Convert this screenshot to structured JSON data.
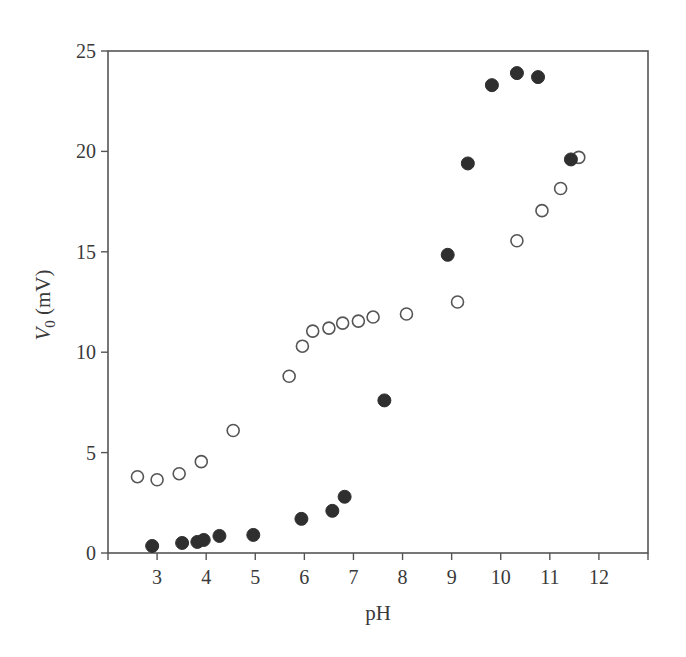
{
  "chart_data": {
    "type": "scatter",
    "title": "",
    "xlabel": "pH",
    "ylabel_main": "V",
    "ylabel_sub": "0",
    "ylabel_unit": " (mV)",
    "ylabel": "V0 (mV)",
    "xlim": [
      2,
      13
    ],
    "ylim": [
      0,
      25
    ],
    "x_ticks": [
      3,
      4,
      5,
      6,
      7,
      8,
      9,
      10,
      11,
      12
    ],
    "y_ticks": [
      0,
      5,
      10,
      15,
      20,
      25
    ],
    "grid": false,
    "legend": null,
    "series": [
      {
        "name": "open circles",
        "marker": "open-circle",
        "points": [
          [
            2.6,
            3.8
          ],
          [
            3.0,
            3.65
          ],
          [
            3.45,
            3.95
          ],
          [
            3.9,
            4.55
          ],
          [
            4.55,
            6.1
          ],
          [
            5.69,
            8.8
          ],
          [
            5.96,
            10.3
          ],
          [
            6.17,
            11.05
          ],
          [
            6.5,
            11.2
          ],
          [
            6.78,
            11.45
          ],
          [
            7.1,
            11.55
          ],
          [
            7.4,
            11.75
          ],
          [
            8.08,
            11.9
          ],
          [
            9.12,
            12.5
          ],
          [
            10.33,
            15.55
          ],
          [
            10.84,
            17.05
          ],
          [
            11.22,
            18.15
          ],
          [
            11.59,
            19.7
          ]
        ]
      },
      {
        "name": "filled circles",
        "marker": "filled-circle",
        "points": [
          [
            2.9,
            0.35
          ],
          [
            3.51,
            0.5
          ],
          [
            3.82,
            0.55
          ],
          [
            3.95,
            0.65
          ],
          [
            4.27,
            0.85
          ],
          [
            4.96,
            0.9
          ],
          [
            5.94,
            1.7
          ],
          [
            6.57,
            2.1
          ],
          [
            6.82,
            2.8
          ],
          [
            7.63,
            7.6
          ],
          [
            8.92,
            14.85
          ],
          [
            9.33,
            19.4
          ],
          [
            9.82,
            23.3
          ],
          [
            10.33,
            23.9
          ],
          [
            10.76,
            23.7
          ],
          [
            11.43,
            19.6
          ]
        ]
      }
    ]
  }
}
